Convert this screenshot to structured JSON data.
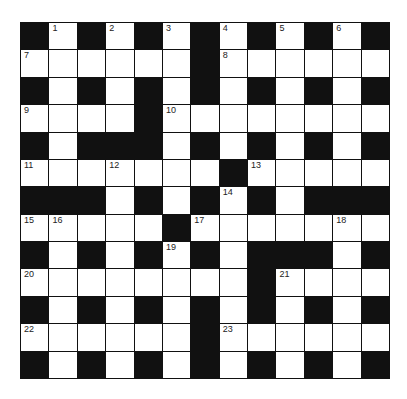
{
  "puzzle": {
    "rows": 13,
    "cols": 13,
    "layout": [
      "#.#.#.#.#.#.#",
      "......#......",
      "#.#.#.#.#.#.#",
      "....#........",
      "#.###.#.#.#.#",
      ".......#.....",
      "###.#.#.#.###",
      ".....#.......",
      "#.#.#.#.###.#",
      "........#....",
      "#.#.#.#.#.#.#",
      "......#......",
      "#.#.#.#.#.#.#"
    ],
    "numbers": [
      {
        "row": 0,
        "col": 1,
        "n": "1"
      },
      {
        "row": 0,
        "col": 3,
        "n": "2"
      },
      {
        "row": 0,
        "col": 5,
        "n": "3"
      },
      {
        "row": 0,
        "col": 7,
        "n": "4"
      },
      {
        "row": 0,
        "col": 9,
        "n": "5"
      },
      {
        "row": 0,
        "col": 11,
        "n": "6"
      },
      {
        "row": 1,
        "col": 0,
        "n": "7"
      },
      {
        "row": 1,
        "col": 7,
        "n": "8"
      },
      {
        "row": 3,
        "col": 0,
        "n": "9"
      },
      {
        "row": 3,
        "col": 5,
        "n": "10"
      },
      {
        "row": 5,
        "col": 0,
        "n": "11"
      },
      {
        "row": 5,
        "col": 3,
        "n": "12"
      },
      {
        "row": 5,
        "col": 8,
        "n": "13"
      },
      {
        "row": 6,
        "col": 7,
        "n": "14"
      },
      {
        "row": 7,
        "col": 0,
        "n": "15"
      },
      {
        "row": 7,
        "col": 1,
        "n": "16"
      },
      {
        "row": 7,
        "col": 6,
        "n": "17"
      },
      {
        "row": 7,
        "col": 11,
        "n": "18"
      },
      {
        "row": 8,
        "col": 5,
        "n": "19"
      },
      {
        "row": 9,
        "col": 0,
        "n": "20"
      },
      {
        "row": 9,
        "col": 9,
        "n": "21"
      },
      {
        "row": 11,
        "col": 0,
        "n": "22"
      },
      {
        "row": 11,
        "col": 7,
        "n": "23"
      }
    ]
  }
}
